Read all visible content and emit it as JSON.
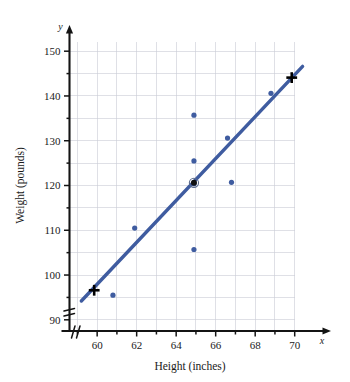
{
  "chart_data": {
    "type": "scatter",
    "title": "",
    "xlabel": "Height (inches)",
    "ylabel": "Weight (pounds)",
    "x_axis_variable": "x",
    "y_axis_variable": "y",
    "xlim": [
      58.6,
      70.8
    ],
    "ylim": [
      87.5,
      152.5
    ],
    "x_ticks": [
      59,
      60,
      61,
      62,
      63,
      64,
      65,
      66,
      67,
      68,
      69,
      70
    ],
    "x_tick_labels": [
      "",
      "60",
      "",
      "62",
      "",
      "64",
      "",
      "66",
      "",
      "68",
      "",
      "70"
    ],
    "y_ticks": [
      90,
      95,
      100,
      105,
      110,
      115,
      120,
      125,
      130,
      135,
      140,
      145,
      150
    ],
    "y_tick_labels": [
      "90",
      "",
      "100",
      "",
      "110",
      "",
      "120",
      "",
      "130",
      "",
      "140",
      "",
      "150"
    ],
    "grid": true,
    "grid_x": [
      59,
      60,
      61,
      62,
      63,
      64,
      65,
      66,
      67,
      68,
      69,
      70
    ],
    "grid_y": [
      90,
      95,
      100,
      105,
      110,
      115,
      120,
      125,
      130,
      135,
      140,
      145,
      150
    ],
    "axis_break_x": true,
    "axis_break_y": true,
    "legend": "none",
    "series": [
      {
        "name": "Height vs Weight observations",
        "type": "scatter",
        "marker": "circle",
        "color": "#3f5ca0",
        "points": [
          {
            "x": 60.8,
            "y": 95.5
          },
          {
            "x": 61.9,
            "y": 110.5
          },
          {
            "x": 64.9,
            "y": 105.7
          },
          {
            "x": 64.9,
            "y": 120.4
          },
          {
            "x": 64.9,
            "y": 125.5
          },
          {
            "x": 64.9,
            "y": 135.7
          },
          {
            "x": 66.8,
            "y": 120.7
          },
          {
            "x": 66.6,
            "y": 130.6
          },
          {
            "x": 68.8,
            "y": 140.6
          }
        ]
      },
      {
        "name": "Regression line",
        "type": "line",
        "color": "#3f5ca0",
        "width": 3.4,
        "endpoints": [
          {
            "x": 59.2,
            "y": 94.2
          },
          {
            "x": 70.4,
            "y": 146.6
          }
        ]
      },
      {
        "name": "Cross markers on line",
        "type": "scatter",
        "marker": "plus",
        "color": "#000000",
        "points": [
          {
            "x": 59.85,
            "y": 96.6
          },
          {
            "x": 69.85,
            "y": 144.1
          }
        ]
      },
      {
        "name": "Centroid highlight",
        "type": "scatter",
        "marker": "circled-dot",
        "color": "#5a6a8c",
        "points": [
          {
            "x": 64.9,
            "y": 120.6
          }
        ]
      }
    ]
  },
  "colors": {
    "data_blue": "#3f5ca0",
    "grid_gray": "#c9ccd6",
    "axis_black": "#141414",
    "background": "#ffffff"
  }
}
